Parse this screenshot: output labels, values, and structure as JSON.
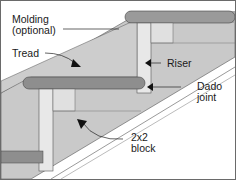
{
  "diagram": {
    "labels": {
      "molding_line1": "Molding",
      "molding_line2": "(optional)",
      "tread": "Tread",
      "riser": "Riser",
      "dado_line1": "Dado",
      "dado_line2": "joint",
      "block_line1": "2x2",
      "block_line2": "block"
    },
    "colors": {
      "tread_top": "#c8c8c8",
      "tread_nose": "#8f8f8f",
      "riser": "#e6e6e6",
      "stringer": "#bdbdbd",
      "block": "#d9d9d9",
      "outline": "#3a3a3a",
      "background": "#ffffff"
    }
  }
}
